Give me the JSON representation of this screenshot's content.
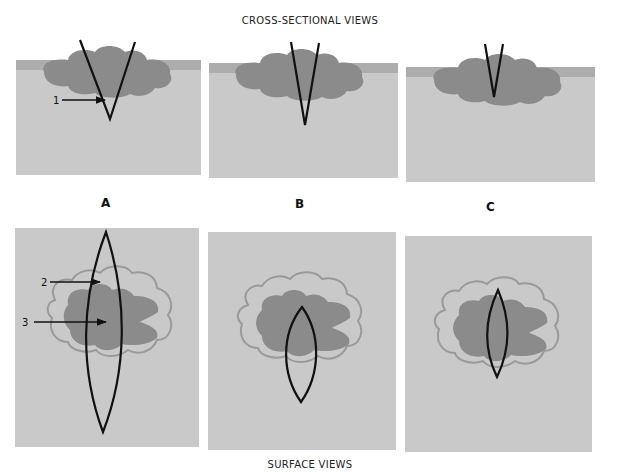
{
  "header": {
    "title": "CROSS-SECTIONAL VIEWS"
  },
  "footer": {
    "title": "SURFACE VIEWS"
  },
  "panels": [
    {
      "letter": "A"
    },
    {
      "letter": "B"
    },
    {
      "letter": "C"
    }
  ],
  "annotations": [
    {
      "number": "1",
      "target": "cross-section A incision depth"
    },
    {
      "number": "2",
      "target": "surface A outer margin"
    },
    {
      "number": "3",
      "target": "surface A lesion"
    }
  ],
  "colors": {
    "background": "#ffffff",
    "tissue": "#c9c9c9",
    "surface_strip": "#adadad",
    "lesion": "#8b8b8b",
    "margin_outline": "#9a9a9a",
    "incision": "#111111"
  }
}
